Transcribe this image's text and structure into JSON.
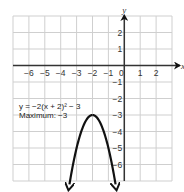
{
  "chart_data": {
    "type": "line",
    "title": "",
    "xlabel": "x",
    "ylabel": "y",
    "xlim": [
      -7,
      3
    ],
    "ylim": [
      -7,
      3
    ],
    "grid": true,
    "x_ticks": [
      -6,
      -5,
      -4,
      -3,
      -2,
      -1,
      0,
      1,
      2
    ],
    "x_tick_labels": [
      "−6",
      "−5",
      "−4",
      "−3",
      "−2",
      "−1",
      "0",
      "1",
      "2"
    ],
    "y_ticks": [
      2,
      1,
      -1,
      -2,
      -3,
      -4,
      -5,
      -6
    ],
    "y_tick_labels": [
      "2",
      "1",
      "−1",
      "−2",
      "−3",
      "−4",
      "−5",
      "−6"
    ],
    "series": [
      {
        "name": "y = −2(x + 2)² − 3",
        "function": "-2*(x+2)^2-3",
        "vertex": [
          -2,
          -3
        ],
        "x_range": [
          -3.45,
          -0.55
        ],
        "arrows_both_ends": true,
        "color": "#111111"
      }
    ],
    "annotations": [
      {
        "text": "y = −2(x + 2)² − 3"
      },
      {
        "text": "Maximum: −3"
      }
    ]
  }
}
